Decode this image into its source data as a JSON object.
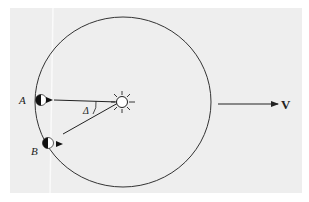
{
  "diagram": {
    "labels": {
      "point_a": "A",
      "point_b": "B",
      "angle": "Δ",
      "velocity": "V"
    },
    "elements": {
      "orbit": "circle",
      "sun": "sun-icon",
      "planet_a": "half-lit-planet-icon",
      "planet_b": "half-lit-planet-icon",
      "ray_a_to_sun": "line from A to Sun",
      "ray_b_to_sun": "line from B to Sun",
      "velocity_arrow": "arrow pointing right"
    },
    "colors": {
      "background": "#eeeeee",
      "stroke": "#222222"
    }
  }
}
